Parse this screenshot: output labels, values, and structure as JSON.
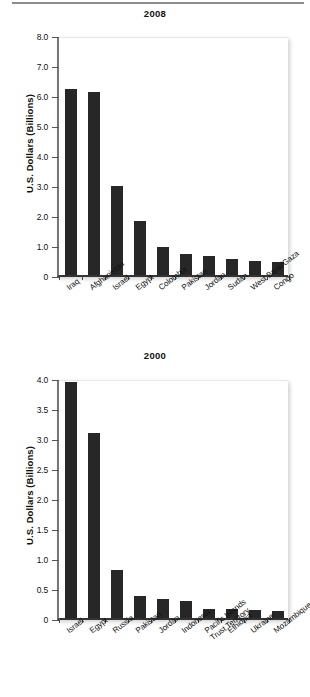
{
  "document": {
    "kind": "two-panel-bar-chart-figure",
    "top_rule": true
  },
  "chart_data": [
    {
      "type": "bar",
      "title": "2008",
      "xlabel": "",
      "ylabel": "U.S. Dollars (Billions)",
      "ylim": [
        0,
        8.0
      ],
      "ytick_labels": [
        "8.0",
        "7.0",
        "6.0",
        "5.0",
        "4.0",
        "3.0",
        "2.0",
        "1.0",
        "0"
      ],
      "ytick_values": [
        8.0,
        7.0,
        6.0,
        5.0,
        4.0,
        3.0,
        2.0,
        1.0,
        0
      ],
      "grid": false,
      "legend": "none",
      "categories": [
        "Iraq",
        "Afghanistan",
        "Israel",
        "Egypt",
        "Colombia",
        "Pakistan",
        "Jordan",
        "Sudan",
        "West Bank/Gaza",
        "Congo"
      ],
      "values": [
        6.2,
        6.1,
        2.97,
        1.8,
        0.92,
        0.7,
        0.63,
        0.52,
        0.47,
        0.45
      ],
      "bar_color": "#272727"
    },
    {
      "type": "bar",
      "title": "2000",
      "xlabel": "",
      "ylabel": "U.S. Dollars (Billions)",
      "ylim": [
        0,
        4.0
      ],
      "ytick_labels": [
        "4.0",
        "3.5",
        "3.0",
        "2.5",
        "2.0",
        "1.5",
        "1.0",
        "0.5",
        "0"
      ],
      "ytick_values": [
        4.0,
        3.5,
        3.0,
        2.5,
        2.0,
        1.5,
        1.0,
        0.5,
        0
      ],
      "grid": false,
      "legend": "none",
      "categories": [
        "Israel",
        "Egypt",
        "Russia",
        "Pakistan",
        "Jordan",
        "Indonesia",
        "Pacific Islands\nTrust Territory",
        "Ethiopia",
        "Ukraine",
        "Mozambique"
      ],
      "values": [
        3.93,
        3.09,
        0.8,
        0.37,
        0.32,
        0.28,
        0.15,
        0.15,
        0.14,
        0.12
      ],
      "bar_color": "#272727"
    }
  ]
}
